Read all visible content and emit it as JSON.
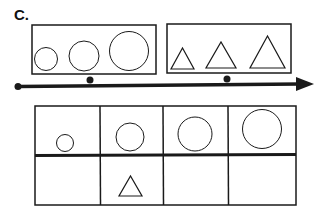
{
  "label": "C.",
  "colors": {
    "stroke": "#1a1a1a",
    "background": "#ffffff"
  },
  "top_groups": [
    {
      "name": "circles",
      "shapes": [
        "circle-small",
        "circle-medium",
        "circle-large"
      ]
    },
    {
      "name": "triangles",
      "shapes": [
        "triangle-small",
        "triangle-medium",
        "triangle-large"
      ]
    }
  ],
  "timeline": {
    "markers": 2,
    "direction": "right"
  },
  "table": {
    "rows": 2,
    "columns": 4,
    "row1": [
      "circle-xsmall",
      "circle-small",
      "circle-medium",
      "circle-large"
    ],
    "row2": [
      "",
      "triangle",
      "",
      ""
    ]
  }
}
